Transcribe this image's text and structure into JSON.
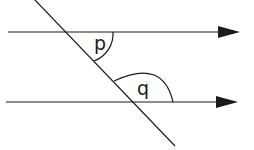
{
  "diagram": {
    "type": "parallel-lines-transversal",
    "colors": {
      "stroke": "#1a1a1a",
      "background": "#ffffff"
    },
    "lines": [
      {
        "id": "top-parallel",
        "x1": 8,
        "y1": 32,
        "x2": 222,
        "y2": 32,
        "arrow": true
      },
      {
        "id": "bottom-parallel",
        "x1": 6,
        "y1": 102,
        "x2": 220,
        "y2": 102,
        "arrow": true
      },
      {
        "id": "transversal",
        "x1": 34,
        "y1": -1,
        "x2": 175,
        "y2": 146,
        "arrow": false
      }
    ],
    "angles": [
      {
        "label": "p",
        "x": 95,
        "y": 50
      },
      {
        "label": "q",
        "x": 137,
        "y": 95
      }
    ]
  }
}
